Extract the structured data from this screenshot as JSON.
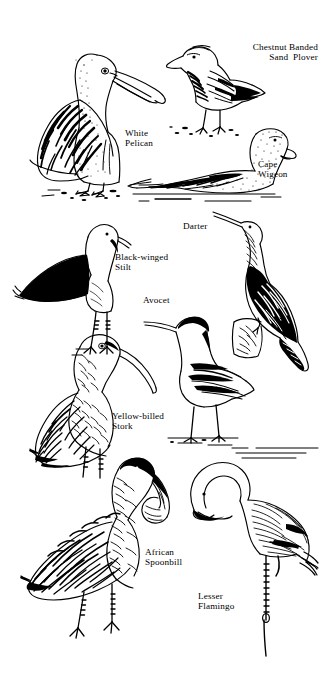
{
  "plate": {
    "title": "African Waterbirds Identification Plate",
    "background_color": "#ffffff",
    "ink_color": "#000000",
    "width": 323,
    "height": 675,
    "style": "black-and-white pen-and-ink line illustration"
  },
  "labels": {
    "white_pelican": "White\nPelican",
    "chestnut_banded_sand_plover": "Chestnut Banded\nSand  Plover",
    "cape_wigeon": "Cape\nWigeon",
    "black_winged_stilt": "Black-winged\nStilt",
    "darter": "Darter",
    "avocet": "Avocet",
    "yellow_billed_stork": "Yellow-billed\nStork",
    "african_spoonbill": "African\nSpoonbill",
    "lesser_flamingo": "Lesser\nFlamingo"
  },
  "birds": [
    {
      "id": "white-pelican",
      "common_name": "White Pelican",
      "label_lines": [
        "White",
        "Pelican"
      ],
      "pose": "standing on ground, left-facing body with long bill to the right"
    },
    {
      "id": "chestnut-banded-sand-plover",
      "common_name": "Chestnut Banded Sand Plover",
      "label_lines": [
        "Chestnut Banded",
        "Sand  Plover"
      ],
      "pose": "standing on sand, left-facing, short bill"
    },
    {
      "id": "cape-wigeon",
      "common_name": "Cape Wigeon",
      "label_lines": [
        "Cape",
        "Wigeon"
      ],
      "pose": "swimming on water, right-facing duck"
    },
    {
      "id": "black-winged-stilt",
      "common_name": "Black-winged Stilt",
      "label_lines": [
        "Black-winged",
        "Stilt"
      ],
      "pose": "standing, long pink legs, solid black wing"
    },
    {
      "id": "darter",
      "common_name": "Darter",
      "label_lines": [
        "Darter"
      ],
      "pose": "perched on stump, snake neck raised, long tail"
    },
    {
      "id": "avocet",
      "common_name": "Avocet",
      "label_lines": [
        "Avocet"
      ],
      "pose": "wading in shallow water, upturned bill"
    },
    {
      "id": "yellow-billed-stork",
      "common_name": "Yellow-billed Stork",
      "label_lines": [
        "Yellow-billed",
        "Stork"
      ],
      "pose": "standing, heavy down-curved bill"
    },
    {
      "id": "african-spoonbill",
      "common_name": "African Spoonbill",
      "label_lines": [
        "African",
        "Spoonbill"
      ],
      "pose": "standing, spatulate spoon bill"
    },
    {
      "id": "lesser-flamingo",
      "common_name": "Lesser Flamingo",
      "label_lines": [
        "Lesser",
        "Flamingo"
      ],
      "pose": "standing in water, neck curved down, one leg"
    }
  ]
}
